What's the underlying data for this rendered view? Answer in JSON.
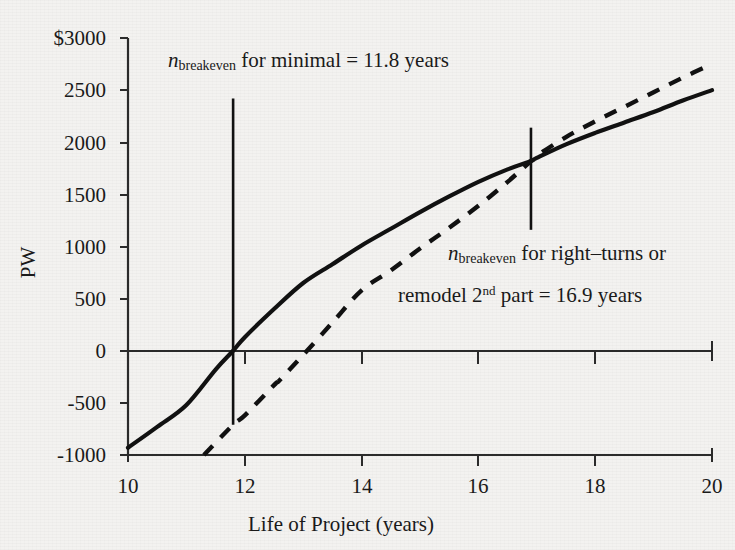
{
  "chart_data": {
    "type": "line",
    "title": "",
    "xlabel": "Life of Project (years)",
    "ylabel": "PW",
    "xlim": [
      10,
      20
    ],
    "ylim": [
      -1000,
      3000
    ],
    "xticks": [
      "10",
      "12",
      "14",
      "16",
      "18",
      "20"
    ],
    "yticks": [
      "$3000",
      "2500",
      "2000",
      "1500",
      "1000",
      "500",
      "0",
      "-500",
      "-1000"
    ],
    "ytick_values": [
      3000,
      2500,
      2000,
      1500,
      1000,
      500,
      0,
      -500,
      -1000
    ],
    "grid": false,
    "legend": "none",
    "series": [
      {
        "name": "minimal",
        "style": "solid",
        "x": [
          10,
          10.5,
          11,
          11.5,
          11.8,
          12,
          12.5,
          13,
          13.5,
          14,
          14.5,
          15,
          15.5,
          16,
          16.5,
          16.9,
          17,
          17.5,
          18,
          18.5,
          19,
          19.5,
          20
        ],
        "y": [
          -930,
          -730,
          -520,
          -180,
          0,
          130,
          400,
          650,
          830,
          1010,
          1170,
          1330,
          1480,
          1620,
          1740,
          1820,
          1850,
          1980,
          2090,
          2190,
          2290,
          2400,
          2500
        ]
      },
      {
        "name": "right-turns or remodel 2nd part",
        "style": "dashed",
        "x": [
          11.3,
          11.8,
          12,
          12.5,
          12.6,
          13,
          13.5,
          14,
          14.5,
          15,
          15.5,
          16,
          16.5,
          16.9,
          17,
          17.5,
          18,
          18.5,
          19,
          19.5,
          20
        ],
        "y": [
          -1000,
          -710,
          -620,
          -330,
          -280,
          -40,
          270,
          580,
          770,
          980,
          1180,
          1390,
          1620,
          1820,
          1870,
          2050,
          2200,
          2340,
          2480,
          2620,
          2750
        ]
      }
    ],
    "markers": [
      {
        "name": "breakeven-minimal",
        "x": 11.8,
        "y_top": 2420,
        "y_bottom": -710
      },
      {
        "name": "breakeven-right-turns",
        "x": 16.9,
        "y_top": 2140,
        "y_bottom": 1160
      }
    ],
    "annotations": [
      {
        "name": "breakeven-minimal-label",
        "symbol": "n",
        "subscript": "breakeven",
        "text": " for minimal = 11.8 years",
        "value": 11.8,
        "units": "years"
      },
      {
        "name": "breakeven-right-turns-label",
        "symbol": "n",
        "subscript": "breakeven",
        "line1_text": " for right–turns or",
        "line2_pre": "remodel 2",
        "line2_sup": "nd",
        "line2_post": " part = 16.9 years",
        "value": 16.9,
        "units": "years"
      }
    ],
    "colors": {
      "background": "#f3f2f0",
      "ink": "#111111",
      "axis": "#2b2b2b"
    }
  }
}
